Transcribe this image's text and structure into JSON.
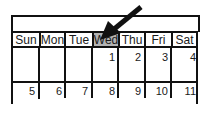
{
  "calendar": {
    "title": "",
    "weekdays": [
      "Sun",
      "Mon",
      "Tue",
      "Wed",
      "Thu",
      "Fri",
      "Sat"
    ],
    "highlighted_day": "Wed",
    "highlight_color": "#b3b3b3",
    "weeks": [
      [
        "",
        "",
        "",
        "1",
        "2",
        "3",
        "4"
      ],
      [
        "5",
        "6",
        "7",
        "8",
        "9",
        "10",
        "11"
      ]
    ]
  },
  "annotation": {
    "icon": "arrow-pointing-icon",
    "target": "Wed"
  }
}
